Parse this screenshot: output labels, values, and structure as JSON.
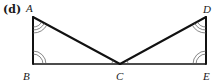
{
  "figure": {
    "part_label": "(d)",
    "vertices": {
      "A": {
        "label": "A",
        "x": 33,
        "y": 17
      },
      "B": {
        "label": "B",
        "x": 33,
        "y": 64
      },
      "C": {
        "label": "C",
        "x": 120,
        "y": 64
      },
      "D": {
        "label": "D",
        "x": 206,
        "y": 17
      },
      "E": {
        "label": "E",
        "x": 206,
        "y": 64
      }
    },
    "segments": [
      "AB",
      "AC",
      "BE",
      "CD",
      "DE"
    ],
    "angle_marks": {
      "A": "double-arc",
      "B": "double-arc (right angle)",
      "C_left": "single-arc",
      "C_right": "single-arc",
      "D": "double-arc",
      "E": "double-arc (right angle)"
    },
    "colors": {
      "line": "#111111",
      "arc": "#555555",
      "background": "#ffffff"
    }
  }
}
